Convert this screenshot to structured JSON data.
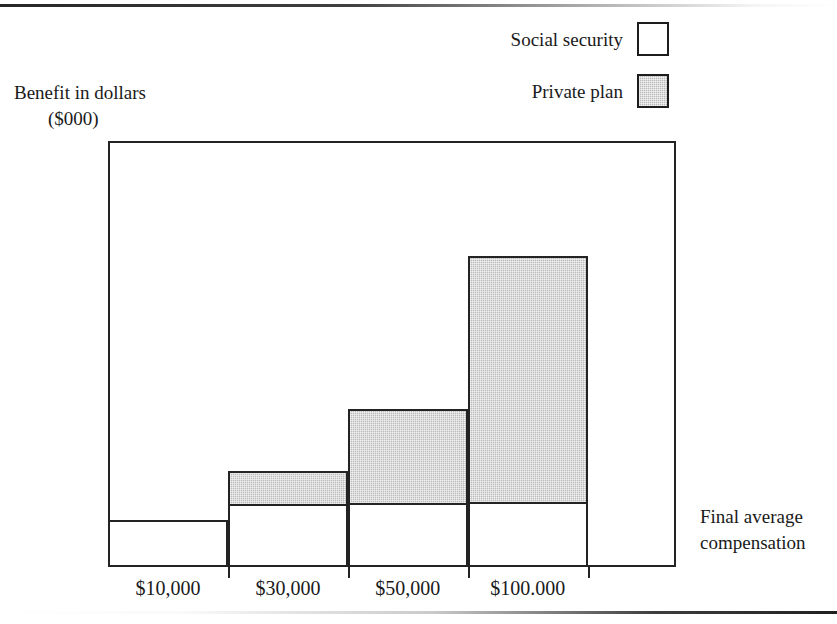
{
  "chart_data": {
    "type": "bar",
    "subtype": "stacked-bar",
    "title": "",
    "xlabel": "Final average compensation",
    "ylabel": "Benefit in dollars ($000)",
    "categories": [
      "$10,000",
      "$30,000",
      "$50,000",
      "$100.000"
    ],
    "series": [
      {
        "name": "Social security",
        "color": "#ffffff",
        "values": [
          7.5,
          10.2,
          10.3,
          10.5
        ]
      },
      {
        "name": "Private plan",
        "color": "#bcbcbc",
        "values": [
          0,
          5.1,
          14.9,
          39.2
        ]
      }
    ],
    "totals": [
      7.5,
      15.3,
      25.2,
      49.7
    ],
    "ylim": [
      0,
      68
    ],
    "yticks": [
      10,
      20,
      30,
      40,
      50
    ],
    "ytick_labels": [
      "10",
      "20",
      "30",
      "40",
      "50"
    ],
    "unlabeled_ytick": 60,
    "grid": false,
    "legend_position": "top-right"
  },
  "legend": {
    "items": [
      {
        "label": "Social security",
        "swatch": "white-square-swatch"
      },
      {
        "label": "Private plan",
        "swatch": "gray-square-swatch"
      }
    ]
  },
  "axes": {
    "y_title_line1": "Benefit in dollars",
    "y_title_line2": "($000)",
    "x_title_line1": "Final average",
    "x_title_line2": "compensation"
  },
  "colors": {
    "ink": "#232323",
    "social_security_fill": "#ffffff",
    "private_plan_fill": "#bcbcbc",
    "page_background": "#ffffff"
  }
}
